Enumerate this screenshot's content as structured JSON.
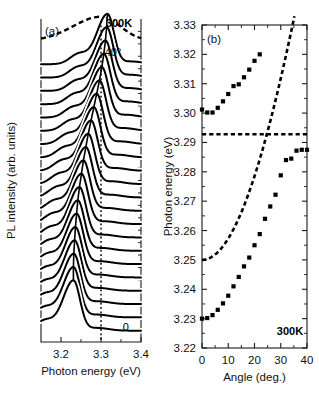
{
  "figure": {
    "width": 319,
    "height": 402,
    "background": "#ffffff",
    "ink_color": "#000000"
  },
  "chart_data": [
    {
      "id": "panel-a",
      "type": "line",
      "panel_label": "(a)",
      "title": "",
      "xlabel": "Photon energy (eV)",
      "ylabel": "PL intensity (arb. units)",
      "xlim": [
        3.15,
        3.4
      ],
      "ylim": [
        0,
        1
      ],
      "xticks": [
        3.2,
        3.3,
        3.4
      ],
      "xticklabels": [
        "3.2",
        "3.3",
        "3.4"
      ],
      "xminorticks": [
        3.15,
        3.25,
        3.35
      ],
      "yticks": [],
      "yticklabels": [],
      "grid": false,
      "legend": false,
      "annotations": [
        {
          "text": "300K",
          "x": 3.345,
          "y": 0.975,
          "bold": true
        },
        {
          "text": "40°",
          "x": 3.33,
          "y": 0.885,
          "bold": false
        },
        {
          "text": "0",
          "x": 3.362,
          "y": 0.035,
          "bold": false
        }
      ],
      "guide_line": {
        "kind": "vertical-dotted",
        "x": 3.3,
        "label": "3.3 eV reference"
      },
      "series_note": "Waterfall of angle-resolved PL spectra, 0° (bottom) to 40° (top) in 2° steps, plus one dashed reference spectrum at top.",
      "n_solid_spectra": 21,
      "angle_start_deg": 0,
      "angle_step_deg": 2,
      "angle_end_deg": 40,
      "dashed_spectrum": {
        "present": true,
        "description": "dashed broad spectrum at top of stack",
        "peak_energy_eV": 3.3
      },
      "spectra_peaks_eV": [
        3.231,
        3.231,
        3.232,
        3.234,
        3.236,
        3.239,
        3.242,
        3.246,
        3.251,
        3.256,
        3.262,
        3.268,
        3.275,
        3.282,
        3.289,
        3.296,
        3.302,
        3.307,
        3.311,
        3.314,
        3.316
      ],
      "lower_branch_visible_peaks_eV": [
        3.231,
        3.231,
        3.232,
        3.234,
        3.236,
        3.239,
        3.242,
        3.246,
        3.251,
        3.256,
        3.262,
        3.268,
        3.275
      ]
    },
    {
      "id": "panel-b",
      "type": "scatter",
      "panel_label": "(b)",
      "title": "",
      "xlabel": "Angle (deg.)",
      "ylabel": "Photon energy (eV)",
      "xlim": [
        0,
        40
      ],
      "ylim": [
        3.22,
        3.33
      ],
      "xticks": [
        0,
        10,
        20,
        30,
        40
      ],
      "xticklabels": [
        "0",
        "10",
        "20",
        "30",
        "40"
      ],
      "xminorticks": [
        5,
        15,
        25,
        35
      ],
      "yticks": [
        3.22,
        3.23,
        3.24,
        3.25,
        3.26,
        3.27,
        3.28,
        3.29,
        3.3,
        3.31,
        3.32,
        3.33
      ],
      "yticklabels": [
        "3.22",
        "3.23",
        "3.24",
        "3.25",
        "3.26",
        "3.27",
        "3.28",
        "3.29",
        "3.30",
        "3.31",
        "3.32",
        "3.33"
      ],
      "grid": false,
      "legend": false,
      "annotations": [
        {
          "text": "300K",
          "x": 33.5,
          "y": 3.2245,
          "bold": true
        }
      ],
      "series": [
        {
          "name": "upper-polariton-branch",
          "marker": "square",
          "x": [
            0,
            2,
            4,
            6,
            8,
            10,
            12,
            14,
            16,
            18
          ],
          "values": [
            3.3012,
            3.3002,
            3.3002,
            3.3018,
            3.304,
            3.3065,
            3.3092,
            3.3098,
            3.3122,
            3.3148
          ]
        },
        {
          "name": "upper-branch-high-angle",
          "marker": "square",
          "x": [
            20,
            22
          ],
          "values": [
            3.3178,
            3.32
          ]
        },
        {
          "name": "lower-polariton-branch",
          "marker": "square",
          "x": [
            0,
            2,
            4,
            6,
            8,
            10,
            12,
            14,
            16,
            18,
            20,
            22,
            24,
            26,
            28
          ],
          "values": [
            3.23,
            3.2302,
            3.2312,
            3.233,
            3.2352,
            3.2378,
            3.241,
            3.2442,
            3.2478,
            3.2508,
            3.255,
            3.2588,
            3.264,
            3.2682,
            3.2722
          ]
        },
        {
          "name": "lower-branch-saturating",
          "marker": "square",
          "x": [
            30,
            32,
            34,
            36,
            38,
            40
          ],
          "values": [
            3.2788,
            3.284,
            3.2845,
            3.2872,
            3.2875,
            3.2875
          ]
        }
      ],
      "model_curves": [
        {
          "name": "exciton-energy",
          "style": "dashed-horizontal",
          "value_eV": 3.2928,
          "x_range": [
            0,
            40
          ]
        },
        {
          "name": "cavity-photon-dispersion",
          "style": "dashed-curve",
          "value_at_zero_eV": 3.25,
          "description": "steeply rising parabolic cavity mode dispersion"
        }
      ]
    }
  ],
  "panel_a": {
    "label": "(a)",
    "xlabel": "Photon energy (eV)",
    "ylabel": "PL intensity (arb. units)",
    "xticklabels": [
      "3.2",
      "3.3",
      "3.4"
    ],
    "temperature_label": "300K",
    "top_angle_label": "40°",
    "bottom_angle_label": "0"
  },
  "panel_b": {
    "label": "(b)",
    "xlabel": "Angle (deg.)",
    "ylabel": "Photon energy (eV)",
    "xticklabels": [
      "0",
      "10",
      "20",
      "30",
      "40"
    ],
    "yticklabels": [
      "3.22",
      "3.23",
      "3.24",
      "3.25",
      "3.26",
      "3.27",
      "3.28",
      "3.29",
      "3.30",
      "3.31",
      "3.32",
      "3.33"
    ],
    "temperature_label": "300K"
  }
}
